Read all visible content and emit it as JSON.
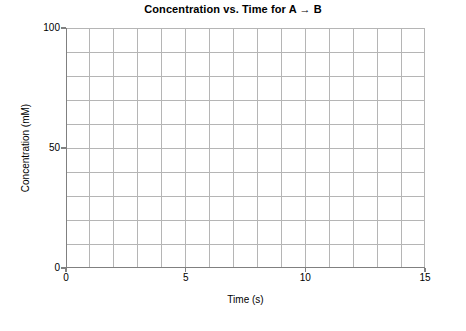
{
  "chart_data": {
    "type": "line",
    "title": "Concentration vs. Time for A → B",
    "xlabel": "Time (s)",
    "ylabel": "Concentration (mM)",
    "xlim": [
      0,
      15
    ],
    "ylim": [
      0,
      100
    ],
    "grid": true,
    "legend": null,
    "series": [],
    "x": [],
    "values": [],
    "xticks": [
      {
        "value": 0,
        "label": "0"
      },
      {
        "value": 5,
        "label": "5"
      },
      {
        "value": 10,
        "label": "10"
      },
      {
        "value": 15,
        "label": "15"
      }
    ],
    "yticks": [
      {
        "value": 0,
        "label": "0"
      },
      {
        "value": 50,
        "label": "50"
      },
      {
        "value": 100,
        "label": "100"
      }
    ],
    "x_gridline_step": 1,
    "y_gridline_step": 10,
    "x_gridline_values": [
      0,
      1,
      2,
      3,
      4,
      5,
      6,
      7,
      8,
      9,
      10,
      11,
      12,
      13,
      14,
      15
    ],
    "y_gridline_values": [
      0,
      10,
      20,
      30,
      40,
      50,
      60,
      70,
      80,
      90,
      100
    ],
    "annotations": []
  },
  "style": {
    "background_color": "#ffffff",
    "grid_color": "#b5b5b5",
    "axis_color": "#808080",
    "text_color": "#000000"
  }
}
